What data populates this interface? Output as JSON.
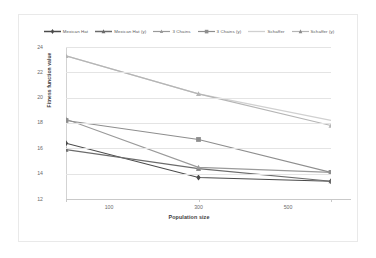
{
  "chart_data": {
    "type": "line",
    "title": "",
    "xlabel": "Population size",
    "ylabel": "Fitness function value",
    "categories": [
      "100",
      "300",
      "500"
    ],
    "x_tick_labels": [
      "100",
      "300",
      "500"
    ],
    "y_tick_labels": [
      "12",
      "14",
      "16",
      "18",
      "20",
      "22",
      "24"
    ],
    "ylim": [
      12,
      24
    ],
    "y_step": 2,
    "grid": true,
    "legend_position": "top",
    "series": [
      {
        "name": "Mexican Hat",
        "values": [
          16.4,
          13.7,
          13.4
        ],
        "color": "#4a4a4a",
        "marker": "plus-diamond"
      },
      {
        "name": "Mexican Hat (y)",
        "values": [
          15.9,
          14.4,
          13.4
        ],
        "color": "#6b6b6b",
        "marker": "triangle"
      },
      {
        "name": "3 Chains",
        "values": [
          18.3,
          14.5,
          14.1
        ],
        "color": "#9a9a9a",
        "marker": "triangle"
      },
      {
        "name": "3 Chains (y)",
        "values": [
          18.2,
          16.7,
          14.1
        ],
        "color": "#8e8e8e",
        "marker": "square"
      },
      {
        "name": "Schaffer",
        "values": [
          23.3,
          20.3,
          18.2
        ],
        "color": "#d0d0d0",
        "marker": "none"
      },
      {
        "name": "Schaffer (y)",
        "values": [
          23.3,
          20.3,
          17.8
        ],
        "color": "#b5b5b5",
        "marker": "triangle"
      }
    ]
  },
  "legend": {
    "items": [
      {
        "label": "Mexican Hat"
      },
      {
        "label": "Mexican Hat (y)"
      },
      {
        "label": "3 Chains"
      },
      {
        "label": "3 Chains (y)"
      },
      {
        "label": "Schaffer"
      },
      {
        "label": "Schaffer (y)"
      }
    ]
  }
}
